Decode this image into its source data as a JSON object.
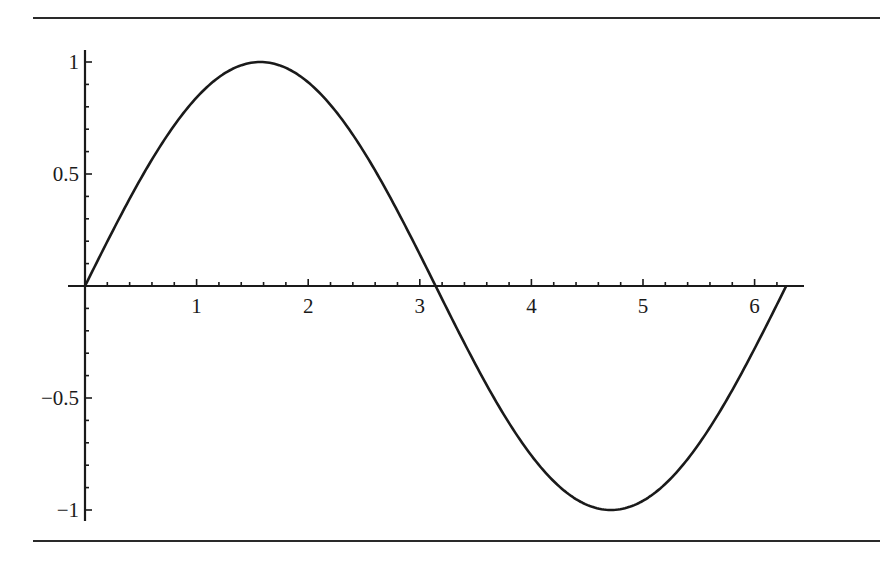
{
  "chart_data": {
    "type": "line",
    "title": "",
    "xlabel": "",
    "ylabel": "",
    "function": "sin(x)",
    "xlim": [
      0,
      6.2832
    ],
    "ylim": [
      -1,
      1
    ],
    "grid": false,
    "legend": null,
    "x_ticks": [
      {
        "value": 1,
        "label": "1"
      },
      {
        "value": 2,
        "label": "2"
      },
      {
        "value": 3,
        "label": "3"
      },
      {
        "value": 4,
        "label": "4"
      },
      {
        "value": 5,
        "label": "5"
      },
      {
        "value": 6,
        "label": "6"
      }
    ],
    "y_ticks": [
      {
        "value": 1,
        "label": "1"
      },
      {
        "value": 0.5,
        "label": "0.5"
      },
      {
        "value": -0.5,
        "label": "−0.5"
      },
      {
        "value": -1,
        "label": "−1"
      }
    ],
    "series": [
      {
        "name": "sin(x)",
        "color": "#1a1a1a",
        "x": [
          0,
          0.5,
          1,
          1.5708,
          2,
          2.5,
          3,
          3.1416,
          3.5,
          4,
          4.5,
          4.7124,
          5,
          5.5,
          6,
          6.2832
        ],
        "y": [
          0,
          0.479,
          0.841,
          1,
          0.909,
          0.598,
          0.141,
          0,
          -0.351,
          -0.757,
          -0.978,
          -1,
          -0.959,
          -0.706,
          -0.279,
          0
        ]
      }
    ]
  },
  "colors": {
    "line": "#1a1a1a",
    "axis": "#1a1a1a",
    "rule": "#2a2a2a",
    "background": "#ffffff"
  }
}
